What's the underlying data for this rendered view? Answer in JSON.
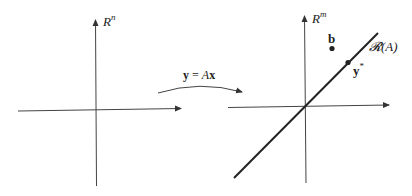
{
  "left_space": {
    "label_base": "R",
    "label_sup": "n"
  },
  "mapping": {
    "label_y": "y",
    "label_eq": " = ",
    "label_A": "A",
    "label_x": "x"
  },
  "right_space": {
    "label_base": "R",
    "label_sup": "m",
    "range_label": "𝓡(A)",
    "point_b": "b",
    "point_y_base": "y",
    "point_y_sup": "*"
  },
  "colors": {
    "stroke": "#333333",
    "text": "#222222"
  }
}
